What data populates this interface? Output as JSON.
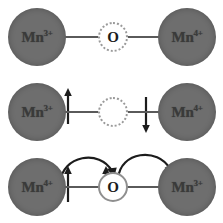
{
  "figure": {
    "background_color": "#ffffff",
    "ion_color": "#6e6e6e",
    "bond_color": "#5a5a5a",
    "arrow_color": "#1c1c1c",
    "oxygen_fill": "#ffffff",
    "oxygen_ring_color": "#8f8f8f"
  },
  "rows": [
    {
      "id": "initial-state",
      "name": "top-row",
      "left_ion": {
        "element": "Mn",
        "charge": "3+",
        "label": "Mn"
      },
      "right_ion": {
        "element": "Mn",
        "charge": "4+",
        "label": "Mn"
      },
      "oxygen": {
        "label": "O",
        "ring_style": "dotted"
      },
      "spins": [
        {
          "id": "left-spin",
          "direction": "up"
        },
        {
          "id": "right-spin",
          "direction": "down"
        }
      ],
      "hop_arrows": []
    },
    {
      "id": "transfer-state",
      "name": "middle-row",
      "left_ion": {
        "element": "Mn",
        "charge": "3+",
        "label": "Mn"
      },
      "right_ion": {
        "element": "Mn",
        "charge": "4+",
        "label": "Mn"
      },
      "oxygen": {
        "label": "O",
        "ring_style": "dotted",
        "paired_spins": "up-down"
      },
      "spins": [
        {
          "id": "left-spin",
          "direction": "up"
        },
        {
          "id": "oxygen-spin-up",
          "direction": "up"
        },
        {
          "id": "oxygen-spin-down",
          "direction": "down"
        }
      ],
      "hop_arrows": [
        {
          "id": "hop-left-to-oxygen",
          "from": "Mn-left",
          "to": "O",
          "direction": "right"
        },
        {
          "id": "hop-oxygen-to-right",
          "from": "O",
          "to": "Mn-right",
          "direction": "right"
        }
      ]
    },
    {
      "id": "final-state",
      "name": "bottom-row",
      "left_ion": {
        "element": "Mn",
        "charge": "4+",
        "label": "Mn"
      },
      "right_ion": {
        "element": "Mn",
        "charge": "3+",
        "label": "Mn"
      },
      "oxygen": {
        "label": "O",
        "ring_style": "solid"
      },
      "spins": [],
      "hop_arrows": []
    }
  ]
}
